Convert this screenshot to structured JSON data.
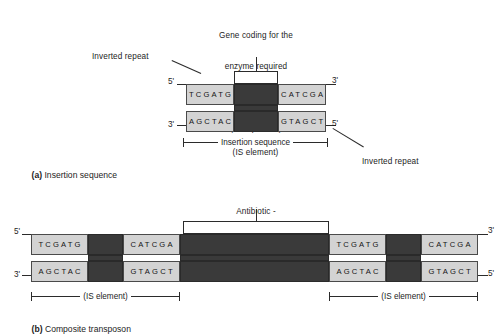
{
  "figure": {
    "background_color": "#ffffff",
    "ink_color": "#2b2b2b",
    "seq_fill": "#d3d3d3",
    "dark_fill": "#3a3a3a"
  },
  "panel_a": {
    "caption_marker": "(a)",
    "caption_text": "Insertion sequence",
    "gene_label": "Gene coding for the\nenzyme required\nfor transposition\n(transposase)",
    "gene_label_lines": [
      "Gene coding for the",
      "enzyme required",
      "for transposition",
      "(transposase)"
    ],
    "inverted_repeat_left": "Inverted repeat",
    "inverted_repeat_right": "Inverted repeat",
    "measure_line1": "Insertion sequence",
    "measure_line2": "(IS element)",
    "top_strand_left_prime": "5'",
    "top_strand_right_prime": "3'",
    "bottom_strand_left_prime": "3'",
    "bottom_strand_right_prime": "5'",
    "top_strand": {
      "left_repeat": "TCGATG",
      "center": "",
      "right_repeat": "CATCGA"
    },
    "bottom_strand": {
      "left_repeat": "AGCTAC",
      "center": "",
      "right_repeat": "GTAGCT"
    }
  },
  "panel_b": {
    "caption_marker": "(b)",
    "caption_text": "Composite transposon",
    "gene_label_lines": [
      "Antibiotic -",
      "resistance gene"
    ],
    "measure_left": "(IS element)",
    "measure_right": "(IS element)",
    "top_strand_left_prime": "5'",
    "top_strand_right_prime": "3'",
    "bottom_strand_left_prime": "3'",
    "bottom_strand_right_prime": "5'",
    "top_strand_segments": [
      "TCGATG",
      "",
      "CATCGA",
      "",
      "TCGATG",
      "",
      "CATCGA"
    ],
    "bottom_strand_segments": [
      "AGCTAC",
      "",
      "GTAGCT",
      "",
      "AGCTAC",
      "",
      "GTAGCT"
    ]
  }
}
